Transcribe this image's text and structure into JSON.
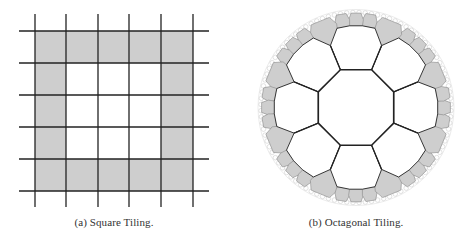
{
  "figure": {
    "panels": [
      {
        "id": "a",
        "caption": "(a) Square Tiling.",
        "type": "square-tiling",
        "grid": {
          "vertical_lines_x": [
            35,
            66,
            98,
            129,
            161,
            193
          ],
          "horizontal_lines_y": [
            31,
            63,
            95,
            127,
            159,
            191
          ],
          "line_extent_x": [
            19,
            209
          ],
          "line_extent_y": [
            14,
            207
          ],
          "shaded_ring": "outer ring of 5x5 cells",
          "cells_rows": 5,
          "cells_cols": 5
        }
      },
      {
        "id": "b",
        "caption": "(b) Octagonal Tiling.",
        "type": "hyperbolic-octagonal-tiling",
        "disk": {
          "cx": 356,
          "cy": 107.5,
          "r": 98
        }
      }
    ],
    "colors": {
      "fill_gray": "#cecece",
      "line_dark": "#222222",
      "tile_stroke": "#8a8a8a",
      "boundary_stroke": "#cfcfcf",
      "background": "#ffffff"
    }
  }
}
